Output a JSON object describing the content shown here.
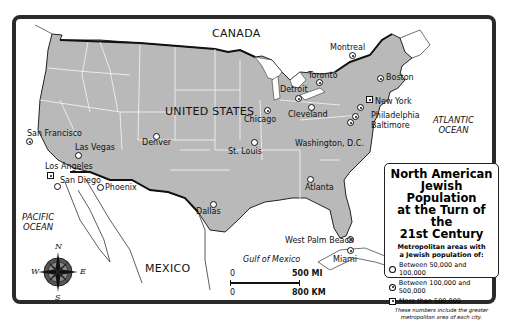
{
  "legend": {
    "title": "North American Jewish Population at the Turn of the 21st Century",
    "title_lines": [
      "North American",
      "Jewish Population",
      "at the Turn of the",
      "21st Century"
    ],
    "subtitle_lines": [
      "Metropolitan areas with",
      "a Jewish population of:"
    ],
    "items": [
      {
        "symbol": "open-circle",
        "label": "Between 50,000 and 100,000"
      },
      {
        "symbol": "dotted-circle",
        "label": "Between 100,000 and 500,000"
      },
      {
        "symbol": "dotted-square",
        "label": "More than 500,000"
      }
    ],
    "note_lines": [
      "These numbers include the greater",
      "metropolitan area of each city."
    ]
  },
  "regions": {
    "canada": "CANADA",
    "united_states": "UNITED STATES",
    "mexico": "MEXICO",
    "pacific": [
      "PACIFIC",
      "OCEAN"
    ],
    "atlantic": [
      "ATLANTIC",
      "OCEAN"
    ],
    "gulf": "Gulf of Mexico"
  },
  "cities": [
    {
      "name": "Montreal",
      "tier": "100k-500k"
    },
    {
      "name": "Toronto",
      "tier": "100k-500k"
    },
    {
      "name": "Boston",
      "tier": "100k-500k"
    },
    {
      "name": "Detroit",
      "tier": "100k-500k"
    },
    {
      "name": "Cleveland",
      "tier": "50k-100k"
    },
    {
      "name": "New York",
      "tier": "500k+"
    },
    {
      "name": "Chicago",
      "tier": "100k-500k"
    },
    {
      "name": "Philadelphia",
      "tier": "100k-500k"
    },
    {
      "name": "Baltimore",
      "tier": "100k-500k"
    },
    {
      "name": "Washington, D.C.",
      "tier": "100k-500k"
    },
    {
      "name": "San Francisco",
      "tier": "100k-500k"
    },
    {
      "name": "Las Vegas",
      "tier": "50k-100k"
    },
    {
      "name": "Denver",
      "tier": "50k-100k"
    },
    {
      "name": "St. Louis",
      "tier": "50k-100k"
    },
    {
      "name": "Los Angeles",
      "tier": "500k+"
    },
    {
      "name": "San Diego",
      "tier": "50k-100k"
    },
    {
      "name": "Phoenix",
      "tier": "50k-100k"
    },
    {
      "name": "Atlanta",
      "tier": "50k-100k"
    },
    {
      "name": "Dallas",
      "tier": "50k-100k"
    },
    {
      "name": "West Palm Beach",
      "tier": "100k-500k"
    },
    {
      "name": "Miami",
      "tier": "100k-500k"
    }
  ],
  "scale": {
    "mi_zero": "0",
    "mi_max": "500 MI",
    "km_zero": "0",
    "km_max": "800 KM"
  },
  "compass": {
    "n": "N",
    "s": "S",
    "e": "E",
    "w": "W"
  }
}
